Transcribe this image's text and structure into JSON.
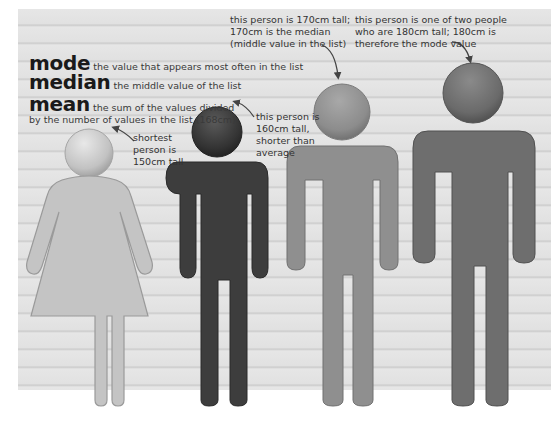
{
  "definitions": {
    "mode": {
      "term": "mode",
      "description": "the value that appears most often in the list"
    },
    "median": {
      "term": "median",
      "description": "the middle value of the list"
    },
    "mean": {
      "term": "mean",
      "description_line1": "the sum of the values divided",
      "description_line2": "by the number of values in the list (168cm)"
    }
  },
  "people": [
    {
      "id": "woman",
      "height_cm": 150,
      "color": "#c4c4c4",
      "annotation": [
        "shortest",
        "person is",
        "150cm tall"
      ]
    },
    {
      "id": "dark-man",
      "height_cm": 160,
      "color": "#3d3d3d",
      "annotation": [
        "this person is",
        "160cm tall,",
        "shorter than",
        "average"
      ]
    },
    {
      "id": "medium-man",
      "height_cm": 170,
      "color": "#8f8f8f",
      "annotation": [
        "this person is 170cm tall;",
        "170cm is the median",
        "(middle value in the list)"
      ]
    },
    {
      "id": "tall-man",
      "height_cm": 180,
      "color": "#6e6e6e",
      "annotation": [
        "this person is one of two people",
        "who are 180cm tall; 180cm is",
        "therefore the mode value"
      ]
    }
  ],
  "colors": {
    "background": "#e3e3e3",
    "stripe": "#c9c9c9",
    "text": "#333333"
  }
}
